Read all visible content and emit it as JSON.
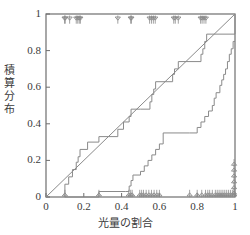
{
  "chart_data": {
    "type": "line",
    "title": "",
    "subtitle": "",
    "xlabel": "光量の割合",
    "ylabel": "積算分布",
    "xlim": [
      0,
      1
    ],
    "ylim": [
      0,
      1
    ],
    "grid": false,
    "legend": "none",
    "xticks": [
      0,
      0.2,
      0.4,
      0.6,
      0.8,
      1
    ],
    "xticklabels": [
      "0",
      "0.2",
      "0.4",
      "0.6",
      "0.8",
      "1"
    ],
    "yticks": [
      0,
      0.2,
      0.4,
      0.6,
      0.8,
      1
    ],
    "yticklabels": [
      "0",
      "0.2",
      "0.4",
      "0.6",
      "0.8",
      "1"
    ],
    "line_color": "#8a8a8a",
    "axis_color": "#6e6e6e",
    "text_color": "#3b3b3b",
    "series": [
      {
        "name": "diagonal-reference",
        "type": "line",
        "style": "solid",
        "x": [
          0,
          1
        ],
        "y": [
          0,
          1
        ]
      },
      {
        "name": "left-step-ecdf",
        "type": "step",
        "style": "post",
        "x": [
          0.1,
          0.1,
          0.12,
          0.14,
          0.16,
          0.17,
          0.18,
          0.22,
          0.28,
          0.33,
          0.38,
          0.41,
          0.44,
          0.45,
          0.5,
          0.55,
          0.56,
          0.57,
          0.58,
          0.67,
          0.68,
          0.7,
          0.82,
          0.83,
          0.84,
          0.85,
          1.0
        ],
        "y": [
          0.0,
          0.07,
          0.11,
          0.15,
          0.19,
          0.22,
          0.26,
          0.3,
          0.33,
          0.33,
          0.37,
          0.41,
          0.44,
          0.48,
          0.48,
          0.52,
          0.56,
          0.59,
          0.63,
          0.67,
          0.7,
          0.74,
          0.78,
          0.81,
          0.85,
          0.89,
          1.0
        ]
      },
      {
        "name": "right-step-ecdf",
        "type": "step",
        "style": "post",
        "x": [
          0.1,
          0.28,
          0.42,
          0.44,
          0.45,
          0.46,
          0.5,
          0.52,
          0.54,
          0.56,
          0.58,
          0.6,
          0.62,
          0.76,
          0.8,
          0.82,
          0.84,
          0.86,
          0.88,
          0.89,
          0.9,
          0.92,
          0.93,
          0.94,
          0.95,
          0.96,
          0.97,
          0.98,
          0.99,
          1.0
        ],
        "y": [
          0.0,
          0.03,
          0.03,
          0.06,
          0.09,
          0.12,
          0.14,
          0.17,
          0.2,
          0.23,
          0.26,
          0.29,
          0.35,
          0.35,
          0.38,
          0.41,
          0.44,
          0.47,
          0.5,
          0.54,
          0.57,
          0.61,
          0.64,
          0.67,
          0.7,
          0.74,
          0.78,
          0.81,
          0.85,
          0.85
        ]
      }
    ],
    "rug_top": {
      "name": "rug-marks-top",
      "marker": "triangle-down",
      "y": 1.0,
      "x": [
        0.098,
        0.102,
        0.125,
        0.16,
        0.168,
        0.176,
        0.182,
        0.38,
        0.448,
        0.452,
        0.548,
        0.558,
        0.568,
        0.578,
        0.676,
        0.684,
        0.7,
        0.818,
        0.826,
        0.836,
        0.846
      ]
    },
    "rug_bottom": {
      "name": "rug-marks-bottom",
      "marker": "triangle-up",
      "y": 0.0,
      "x": [
        0.1,
        0.28,
        0.438,
        0.448,
        0.456,
        0.496,
        0.506,
        0.516,
        0.53,
        0.544,
        0.558,
        0.572,
        0.586,
        0.6,
        0.76,
        0.8,
        0.824,
        0.844,
        0.856,
        0.866,
        0.88,
        0.896,
        0.906,
        0.916,
        0.926,
        0.936,
        0.946,
        0.956,
        0.966,
        0.976,
        0.986,
        0.996
      ]
    },
    "rug_right_stack": {
      "name": "rug-marks-right-stack",
      "marker": "triangle-up",
      "x": 0.995,
      "y": [
        0.01,
        0.04,
        0.072,
        0.104,
        0.136,
        0.168
      ]
    }
  }
}
